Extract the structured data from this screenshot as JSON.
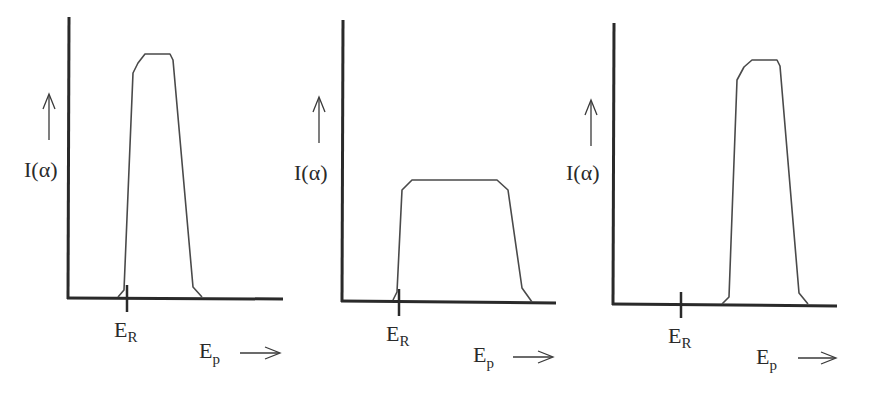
{
  "chart_data": [
    {
      "type": "line",
      "panel": 1,
      "ylabel": "I(α)",
      "xlabel": "Ep",
      "marker_label": "ER",
      "description": "Tall narrow peak starting just below ER, plateau high",
      "points": [
        [
          118,
          297
        ],
        [
          124,
          290
        ],
        [
          133,
          73
        ],
        [
          138,
          63
        ],
        [
          145,
          54
        ],
        [
          170,
          54
        ],
        [
          173,
          60
        ],
        [
          193,
          287
        ],
        [
          202,
          297
        ]
      ],
      "axis": {
        "x0": 68,
        "y0": 298,
        "x1": 283,
        "ytop": 17
      },
      "marker_x": 127
    },
    {
      "type": "line",
      "panel": 2,
      "ylabel": "I(α)",
      "xlabel": "Ep",
      "marker_label": "ER",
      "description": "Broad low plateau starting at ER",
      "points": [
        [
          393,
          300
        ],
        [
          397,
          292
        ],
        [
          402,
          190
        ],
        [
          412,
          180
        ],
        [
          497,
          180
        ],
        [
          508,
          190
        ],
        [
          522,
          288
        ],
        [
          532,
          302
        ]
      ],
      "axis": {
        "x0": 342,
        "y0": 302,
        "x1": 556,
        "ytop": 20
      },
      "marker_x": 399
    },
    {
      "type": "line",
      "panel": 3,
      "ylabel": "I(α)",
      "xlabel": "Ep",
      "marker_label": "ER",
      "description": "Tall narrow peak shifted well above ER",
      "points": [
        [
          722,
          304
        ],
        [
          729,
          297
        ],
        [
          737,
          80
        ],
        [
          744,
          67
        ],
        [
          752,
          60
        ],
        [
          777,
          60
        ],
        [
          780,
          66
        ],
        [
          799,
          293
        ],
        [
          808,
          304
        ]
      ],
      "axis": {
        "x0": 613,
        "y0": 304,
        "x1": 837,
        "ytop": 23
      },
      "marker_x": 681
    }
  ],
  "labels": {
    "y_main": "I(α)",
    "x_main": "E",
    "x_sub": "p",
    "marker_main": "E",
    "marker_sub": "R",
    "x_arrow": "→"
  }
}
